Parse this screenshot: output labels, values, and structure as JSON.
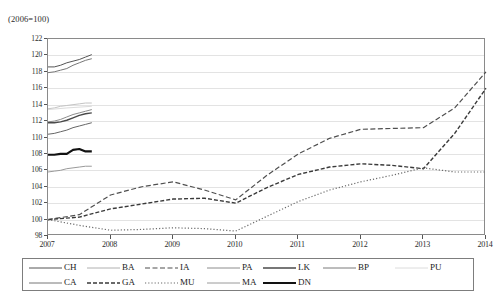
{
  "chart_data": {
    "type": "line",
    "title": "",
    "subtitle": "(2006=100)",
    "xlabel": "",
    "ylabel": "",
    "xlim": [
      2007,
      2014
    ],
    "ylim": [
      98,
      122
    ],
    "yticks": [
      98,
      100,
      102,
      104,
      106,
      108,
      110,
      112,
      114,
      116,
      118,
      120,
      122
    ],
    "xticks": [
      "2007",
      "2008",
      "2009",
      "2010",
      "2011",
      "2012",
      "2013",
      "2014"
    ],
    "grid": true,
    "legend_position": "bottom",
    "series": [
      {
        "name": "CH",
        "style": "solid",
        "color": "#555555",
        "width": 1.0,
        "x": [
          2007.0,
          2007.1,
          2007.2,
          2007.3,
          2007.4,
          2007.5,
          2007.6,
          2007.7
        ],
        "values": [
          118.6,
          118.6,
          118.8,
          119.1,
          119.3,
          119.5,
          119.8,
          120.1
        ]
      },
      {
        "name": "CA",
        "style": "solid",
        "color": "#777777",
        "width": 1.0,
        "x": [
          2007.0,
          2007.1,
          2007.2,
          2007.3,
          2007.4,
          2007.5,
          2007.6,
          2007.7
        ],
        "values": [
          117.9,
          118.0,
          118.2,
          118.4,
          118.8,
          119.1,
          119.4,
          119.6
        ]
      },
      {
        "name": "BA",
        "style": "solid",
        "color": "#c4c4c4",
        "width": 1.0,
        "x": [
          2007.0,
          2007.1,
          2007.2,
          2007.3,
          2007.4,
          2007.5,
          2007.6,
          2007.7
        ],
        "values": [
          113.5,
          113.6,
          113.8,
          113.9,
          114.0,
          114.1,
          114.2,
          114.2
        ]
      },
      {
        "name": "PA",
        "style": "solid",
        "color": "#8c8c8c",
        "width": 1.0,
        "x": [
          2007.0,
          2007.1,
          2007.2,
          2007.3,
          2007.4,
          2007.5,
          2007.6,
          2007.7
        ],
        "values": [
          111.9,
          112.0,
          112.2,
          112.5,
          112.8,
          113.0,
          113.2,
          113.4
        ]
      },
      {
        "name": "LK",
        "style": "solid",
        "color": "#4a4a4a",
        "width": 1.4,
        "x": [
          2007.0,
          2007.1,
          2007.2,
          2007.3,
          2007.4,
          2007.5,
          2007.6,
          2007.7
        ],
        "values": [
          111.8,
          111.8,
          111.9,
          112.1,
          112.4,
          112.7,
          112.9,
          113.0
        ]
      },
      {
        "name": "MA",
        "style": "solid",
        "color": "#666666",
        "width": 1.0,
        "x": [
          2007.0,
          2007.1,
          2007.2,
          2007.3,
          2007.4,
          2007.5,
          2007.6,
          2007.7
        ],
        "values": [
          110.4,
          110.5,
          110.7,
          110.9,
          111.2,
          111.4,
          111.6,
          111.8
        ]
      },
      {
        "name": "DN",
        "style": "solid",
        "color": "#121212",
        "width": 2.2,
        "x": [
          2007.0,
          2007.1,
          2007.2,
          2007.3,
          2007.4,
          2007.5,
          2007.6,
          2007.7
        ],
        "values": [
          107.9,
          107.9,
          108.0,
          108.0,
          108.5,
          108.6,
          108.3,
          108.3
        ]
      },
      {
        "name": "BP",
        "style": "solid",
        "color": "#9a9a9a",
        "width": 1.0,
        "x": [
          2007.0,
          2007.1,
          2007.2,
          2007.3,
          2007.4,
          2007.5,
          2007.6,
          2007.7
        ],
        "values": [
          105.8,
          105.9,
          106.0,
          106.2,
          106.3,
          106.4,
          106.5,
          106.5
        ]
      },
      {
        "name": "PU",
        "style": "solid",
        "color": "#dcdcdc",
        "width": 1.0,
        "x": [
          2007.0,
          2007.3,
          2007.7
        ],
        "values": [
          113.4,
          113.6,
          113.8
        ]
      },
      {
        "name": "IA",
        "style": "dashed",
        "color": "#4f4f4f",
        "width": 1.2,
        "x": [
          2007.0,
          2007.5,
          2008.0,
          2008.5,
          2009.0,
          2009.5,
          2010.0,
          2010.5,
          2011.0,
          2011.5,
          2012.0,
          2012.5,
          2013.0,
          2013.5,
          2014.0
        ],
        "values": [
          100.0,
          100.6,
          103.0,
          104.0,
          104.6,
          103.6,
          102.4,
          105.4,
          108.0,
          109.9,
          111.0,
          111.1,
          111.2,
          113.6,
          118.0
        ]
      },
      {
        "name": "GA",
        "style": "dashdot",
        "color": "#3a3a3a",
        "width": 1.4,
        "x": [
          2007.0,
          2007.5,
          2008.0,
          2008.5,
          2009.0,
          2009.5,
          2010.0,
          2010.5,
          2011.0,
          2011.5,
          2012.0,
          2012.5,
          2013.0,
          2013.5,
          2014.0
        ],
        "values": [
          100.0,
          100.3,
          101.3,
          101.9,
          102.5,
          102.6,
          102.0,
          103.9,
          105.5,
          106.4,
          106.8,
          106.6,
          106.2,
          110.5,
          116.0
        ]
      },
      {
        "name": "MU",
        "style": "dotted",
        "color": "#6b6b6b",
        "width": 1.2,
        "x": [
          2007.0,
          2007.5,
          2008.0,
          2008.5,
          2009.0,
          2009.5,
          2010.0,
          2010.5,
          2011.0,
          2011.5,
          2012.0,
          2012.5,
          2013.0,
          2013.5,
          2014.0
        ],
        "values": [
          100.0,
          99.3,
          98.7,
          98.8,
          99.0,
          98.9,
          98.6,
          100.4,
          102.2,
          103.6,
          104.6,
          105.4,
          106.3,
          105.8,
          105.8
        ]
      }
    ]
  },
  "legend": {
    "rows": [
      [
        {
          "label": "CH",
          "style": "solid",
          "color": "#555555",
          "width": 1.0
        },
        {
          "label": "BA",
          "style": "solid",
          "color": "#b0b0b0",
          "width": 1.0
        },
        {
          "label": "IA",
          "style": "dashed",
          "color": "#4f4f4f",
          "width": 1.2
        },
        {
          "label": "PA",
          "style": "solid",
          "color": "#8c8c8c",
          "width": 1.0
        },
        {
          "label": "LK",
          "style": "solid",
          "color": "#4a4a4a",
          "width": 1.4
        },
        {
          "label": "BP",
          "style": "solid",
          "color": "#7a7a7a",
          "width": 1.0
        },
        {
          "label": "PU",
          "style": "solid",
          "color": "#dcdcdc",
          "width": 1.0
        }
      ],
      [
        {
          "label": "CA",
          "style": "solid",
          "color": "#777777",
          "width": 1.0
        },
        {
          "label": "GA",
          "style": "dashdot",
          "color": "#3a3a3a",
          "width": 1.6
        },
        {
          "label": "MU",
          "style": "dotted",
          "color": "#6b6b6b",
          "width": 1.2
        },
        {
          "label": "MA",
          "style": "solid",
          "color": "#9a9a9a",
          "width": 1.0
        },
        {
          "label": "DN",
          "style": "solid",
          "color": "#121212",
          "width": 2.2
        }
      ]
    ]
  }
}
